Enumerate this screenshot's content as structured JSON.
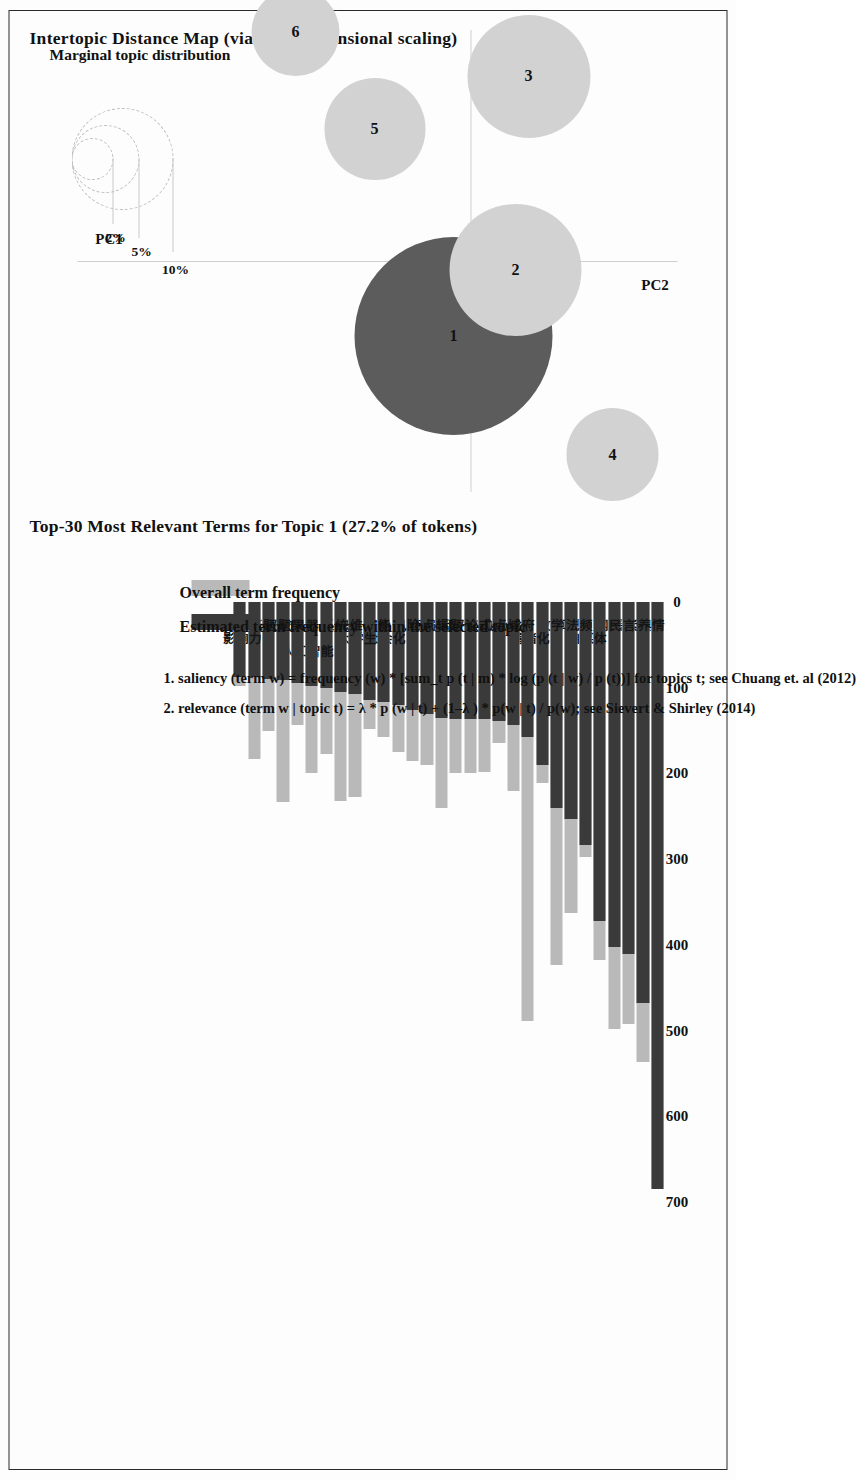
{
  "document": {
    "kind": "pyLDAvis topic model visualization (scanned page, rotated 90 degrees)"
  },
  "intertopic_map": {
    "title": "Intertopic Distance Map (via multidimensional scaling)",
    "axis_x_label": "PC1",
    "axis_y_label": "PC2",
    "size_legend": {
      "title": "Marginal topic distribution",
      "ticks": [
        "2%",
        "5%",
        "10%"
      ]
    },
    "topics": [
      {
        "label": "1",
        "x": 0.17,
        "y": -0.04,
        "r": 0.225,
        "shade": "dark"
      },
      {
        "label": "2",
        "x": 0.02,
        "y": 0.1,
        "r": 0.15,
        "shade": "light"
      },
      {
        "label": "3",
        "x": -0.42,
        "y": 0.13,
        "r": 0.14,
        "shade": "light"
      },
      {
        "label": "4",
        "x": 0.44,
        "y": 0.32,
        "r": 0.105,
        "shade": "light"
      },
      {
        "label": "5",
        "x": -0.3,
        "y": -0.22,
        "r": 0.115,
        "shade": "light"
      },
      {
        "label": "6",
        "x": -0.52,
        "y": -0.4,
        "r": 0.1,
        "shade": "light"
      }
    ]
  },
  "bar_panel": {
    "title": "Top-30 Most Relevant Terms for Topic 1 (27.2% of tokens)",
    "legend": [
      {
        "key": "overall",
        "label": "Overall term frequency",
        "color": "#b9b9b9"
      },
      {
        "key": "estimated",
        "label": "Estimated term frequency within the selected topic",
        "color": "#3a3a3a"
      }
    ],
    "notes": [
      "1. saliency (term w) = frequency (w) * [sum_t p (t | m) * log (p (t | w) / p (t))] for topics t; see Chuang et. al (2012)",
      "2. relevance (term w | topic t) = λ * p (w | t) + (1–λ ) * p(w | t) / p(w); see Sievert & Shirley (2014)"
    ]
  },
  "chart_data": {
    "type": "bar",
    "title": "Top-30 Most Relevant Terms for Topic 1 (27.2% of tokens)",
    "xlabel": "",
    "ylabel": "",
    "xlim": [
      0,
      700
    ],
    "xticks": [
      0,
      100,
      200,
      300,
      400,
      500,
      600,
      700
    ],
    "grid": false,
    "legend_position": "bottom",
    "orientation": "horizontal",
    "categories": [
      "舆情",
      "素养",
      "谣言",
      "网民",
      "自媒体",
      "视频",
      "算法",
      "数学",
      "情绪化",
      "政府",
      "场域",
      "热点",
      "仪式",
      "评论",
      "话题",
      "编辑",
      "特点",
      "风险",
      "社会化",
      "智能",
      "大学生",
      "思维",
      "系统",
      "人工智能",
      "机器",
      "效果",
      "议题",
      "标题",
      "影响力",
      "圈子"
    ],
    "series": [
      {
        "name": "Overall term frequency",
        "values": [
          685,
          537,
          492,
          498,
          418,
          298,
          363,
          424,
          211,
          489,
          221,
          164,
          198,
          200,
          200,
          240,
          190,
          186,
          175,
          157,
          148,
          228,
          232,
          177,
          199,
          143,
          233,
          151,
          183,
          98
        ]
      },
      {
        "name": "Estimated term frequency within the selected topic",
        "values": [
          685,
          468,
          411,
          403,
          372,
          284,
          253,
          240,
          190,
          157,
          143,
          139,
          137,
          136,
          136,
          135,
          131,
          126,
          120,
          117,
          114,
          107,
          105,
          100,
          98,
          95,
          91,
          90,
          88,
          88
        ]
      }
    ]
  }
}
